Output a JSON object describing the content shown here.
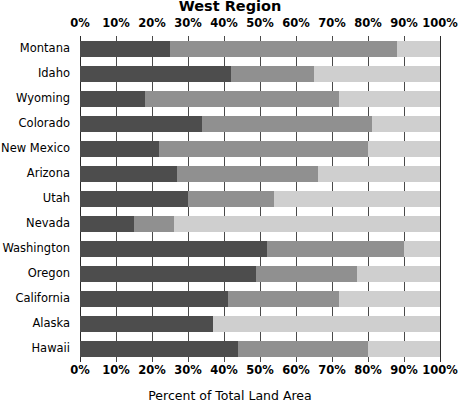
{
  "chart_data": {
    "type": "bar",
    "orientation": "horizontal",
    "stacked": true,
    "normalized_percent": true,
    "title": "West Region",
    "xlabel": "Percent of Total Land Area",
    "ylabel": "",
    "xlim": [
      0,
      100
    ],
    "xticks": [
      0,
      10,
      20,
      30,
      40,
      50,
      60,
      70,
      80,
      90,
      100
    ],
    "xtick_labels": [
      "0%",
      "10%",
      "20%",
      "30%",
      "40%",
      "50%",
      "60%",
      "70%",
      "80%",
      "90%",
      "100%"
    ],
    "grid": true,
    "legend": "none",
    "categories": [
      "Montana",
      "Idaho",
      "Wyoming",
      "Colorado",
      "New Mexico",
      "Arizona",
      "Utah",
      "Nevada",
      "Washington",
      "Oregon",
      "California",
      "Alaska",
      "Hawaii"
    ],
    "series": [
      {
        "name": "Segment A",
        "color": "#4d4d4d",
        "values": [
          25,
          42,
          18,
          34,
          22,
          27,
          30,
          15,
          52,
          49,
          41,
          37,
          44
        ]
      },
      {
        "name": "Segment B",
        "color": "#909090",
        "values": [
          63,
          23,
          54,
          47,
          58,
          39,
          24,
          11,
          38,
          28,
          31,
          0,
          36
        ]
      },
      {
        "name": "Segment C",
        "color": "#cfcfcf",
        "values": [
          12,
          35,
          28,
          19,
          20,
          34,
          46,
          74,
          10,
          23,
          28,
          63,
          20
        ]
      }
    ]
  },
  "axis_title_bottom": "Percent of Total Land Area",
  "title": "West Region"
}
